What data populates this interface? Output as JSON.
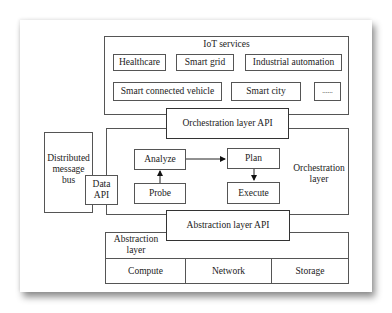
{
  "diagram": {
    "iot_services": {
      "title": "IoT services",
      "items": [
        "Healthcare",
        "Smart grid",
        "Industrial automation",
        "Smart connected vehicle",
        "Smart city",
        "......"
      ]
    },
    "orchestration_api": "Orchestration layer API",
    "orchestration_layer": {
      "title_line1": "Orchestration",
      "title_line2": "layer",
      "nodes": {
        "analyze": "Analyze",
        "plan": "Plan",
        "probe": "Probe",
        "execute": "Execute"
      },
      "edges": [
        {
          "from": "Probe",
          "to": "Analyze"
        },
        {
          "from": "Analyze",
          "to": "Plan"
        },
        {
          "from": "Plan",
          "to": "Execute"
        }
      ]
    },
    "message_bus": {
      "line1": "Distributed",
      "line2": "message",
      "line3": "bus"
    },
    "data_api": {
      "line1": "Data",
      "line2": "API"
    },
    "abstraction_api": "Abstraction layer API",
    "abstraction_layer": {
      "title_line1": "Abstraction",
      "title_line2": "layer",
      "resources": [
        "Compute",
        "Network",
        "Storage"
      ]
    }
  }
}
